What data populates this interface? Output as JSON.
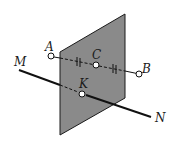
{
  "diagram": {
    "type": "geometry",
    "colors": {
      "plane_fill": "#8a8a8a",
      "plane_edge": "#1a1a1a",
      "line": "#111111",
      "background": "#ffffff"
    },
    "points": {
      "A": {
        "label": "A",
        "x": 51,
        "y": 56
      },
      "B": {
        "label": "B",
        "x": 139,
        "y": 74
      },
      "C": {
        "label": "C",
        "x": 96,
        "y": 65
      },
      "K": {
        "label": "K",
        "x": 82,
        "y": 94
      },
      "M": {
        "label": "M",
        "x": 19,
        "y": 70
      },
      "N": {
        "label": "N",
        "x": 151,
        "y": 117
      }
    },
    "labels": {
      "A": "A",
      "B": "B",
      "C": "C",
      "K": "K",
      "M": "M",
      "N": "N"
    },
    "plane": {
      "vertices": [
        [
          60,
          52
        ],
        [
          125,
          14
        ],
        [
          125,
          98
        ],
        [
          60,
          135
        ]
      ]
    }
  }
}
